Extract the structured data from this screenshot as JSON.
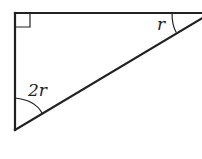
{
  "diagram": {
    "type": "right-triangle",
    "angles": {
      "top_left": "right-angle",
      "top_right": {
        "label": "r"
      },
      "bottom_left": {
        "label": "2r"
      }
    },
    "colors": {
      "stroke": "#222222",
      "background": "#ffffff"
    }
  }
}
